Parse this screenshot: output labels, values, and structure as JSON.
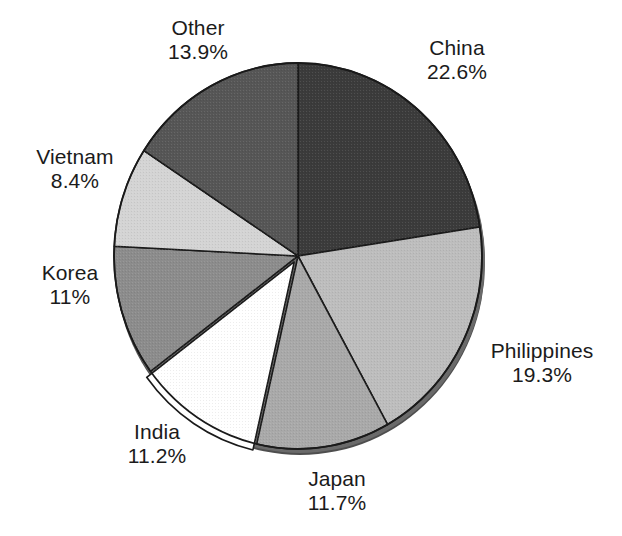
{
  "chart_data": {
    "type": "pie",
    "title": "",
    "subtitle": "",
    "xlabel": "",
    "ylabel": "",
    "legend_position": "none",
    "grid": false,
    "labels_outside": true,
    "start_angle_deg": 0,
    "direction": "clockwise",
    "categories": [
      "China",
      "Philippines",
      "Japan",
      "India",
      "Korea",
      "Vietnam",
      "Other"
    ],
    "values": [
      22.6,
      19.3,
      11.7,
      11.2,
      11.0,
      8.4,
      13.9
    ],
    "value_unit": "%",
    "slices": [
      {
        "name": "China",
        "label": "China",
        "value": 22.6,
        "value_text": "22.6%",
        "color": "#3b3b3b",
        "start_deg": 0.0,
        "end_deg": 81.36
      },
      {
        "name": "Philippines",
        "label": "Philippines",
        "value": 19.3,
        "value_text": "19.3%",
        "color": "#bdbdbd",
        "start_deg": 81.36,
        "end_deg": 150.84
      },
      {
        "name": "Japan",
        "label": "Japan",
        "value": 11.7,
        "value_text": "11.7%",
        "color": "#a9a9a9",
        "start_deg": 150.84,
        "end_deg": 192.96
      },
      {
        "name": "India",
        "label": "India",
        "value": 11.2,
        "value_text": "11.2%",
        "color": "#ffffff",
        "start_deg": 192.96,
        "end_deg": 233.28
      },
      {
        "name": "Korea",
        "label": "Korea",
        "value": 11.0,
        "value_text": "11%",
        "color": "#8c8c8c",
        "start_deg": 233.28,
        "end_deg": 272.88
      },
      {
        "name": "Vietnam",
        "label": "Vietnam",
        "value": 8.4,
        "value_text": "8.4%",
        "color": "#d4d4d4",
        "start_deg": 272.88,
        "end_deg": 303.12
      },
      {
        "name": "Other",
        "label": "Other",
        "value": 13.9,
        "value_text": "13.9%",
        "color": "#565656",
        "start_deg": 303.12,
        "end_deg": 360.0
      }
    ],
    "colors": {
      "background": "#ffffff",
      "outline": "#1a1a1a",
      "shadow_rim": "#4a4a4a",
      "text": "#1b1b1b"
    }
  }
}
